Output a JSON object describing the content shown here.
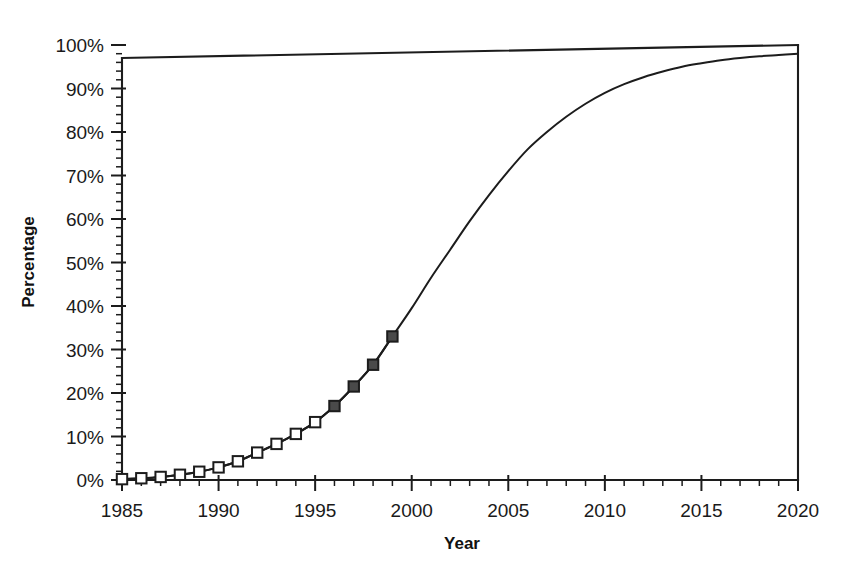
{
  "chart_data": {
    "type": "line",
    "title": "",
    "xlabel": "Year",
    "ylabel": "Percentage",
    "xlim": [
      1985,
      2020
    ],
    "ylim": [
      0,
      100
    ],
    "grid": false,
    "legend": "none",
    "x_ticks": [
      1985,
      1990,
      1995,
      2000,
      2005,
      2010,
      2015,
      2020
    ],
    "x_tick_labels": [
      "1985",
      "1990",
      "1995",
      "2000",
      "2005",
      "2010",
      "2015",
      "2020"
    ],
    "x_minor_tick_interval": 1,
    "y_ticks": [
      0,
      10,
      20,
      30,
      40,
      50,
      60,
      70,
      80,
      90,
      100
    ],
    "y_tick_labels": [
      "0%",
      "10%",
      "20%",
      "30%",
      "40%",
      "50%",
      "60%",
      "70%",
      "80%",
      "90%",
      "100%"
    ],
    "y_minor_tick_interval": 2,
    "series": [
      {
        "name": "Percentage",
        "marker": "square",
        "line_color": "#1c1c1c",
        "x": [
          1985,
          1986,
          1987,
          1988,
          1989,
          1990,
          1991,
          1992,
          1993,
          1994,
          1995,
          1996,
          1997,
          1998,
          1999
        ],
        "values": [
          0.2,
          0.4,
          0.7,
          1.2,
          1.9,
          2.9,
          4.3,
          6.3,
          8.3,
          10.6,
          13.3,
          17.0,
          21.5,
          26.5,
          33.0
        ],
        "marker_styles": [
          "open",
          "open",
          "open",
          "open",
          "open",
          "open",
          "open",
          "open",
          "open",
          "open",
          "open",
          "filled",
          "filled",
          "filled",
          "filled"
        ]
      },
      {
        "name": "Projection curve",
        "marker": "none",
        "line_color": "#1c1c1c",
        "x": [
          1985,
          1986,
          1987,
          1988,
          1989,
          1990,
          1991,
          1992,
          1993,
          1994,
          1995,
          1996,
          1997,
          1998,
          1999,
          2000,
          2001,
          2002,
          2003,
          2004,
          2005,
          2006,
          2007,
          2008,
          2009,
          2010,
          2011,
          2012,
          2013,
          2014,
          2015,
          2016,
          2017,
          2018,
          2019,
          2020
        ],
        "values": [
          0.2,
          0.4,
          0.7,
          1.2,
          1.9,
          2.9,
          4.3,
          6.3,
          8.3,
          10.6,
          13.3,
          17.0,
          21.5,
          26.5,
          33.0,
          39.5,
          46.5,
          53.0,
          59.5,
          65.5,
          71.0,
          76.0,
          80.0,
          83.5,
          86.5,
          89.0,
          91.0,
          92.6,
          93.9,
          95.0,
          95.8,
          96.5,
          97.0,
          97.4,
          97.7,
          98.0
        ]
      }
    ],
    "colors": {
      "axis": "#1c1c1c",
      "line": "#1c1c1c",
      "marker_fill_open": "#ffffff",
      "marker_fill_filled": "#4a4a4a",
      "background": "#ffffff"
    }
  },
  "labels": {
    "x_axis_title": "Year",
    "y_axis_title": "Percentage"
  }
}
